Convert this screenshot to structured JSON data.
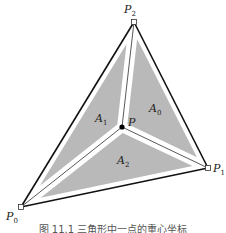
{
  "figure": {
    "caption": "图 11.1  三角形中一点的重心坐标",
    "colors": {
      "region_fill": "#b9b9b9",
      "gap": "#ffffff",
      "edge": "#111111",
      "point": "#000000"
    },
    "vertices": [
      {
        "id": "P0",
        "label": "P",
        "sub": "0"
      },
      {
        "id": "P1",
        "label": "P",
        "sub": "1"
      },
      {
        "id": "P2",
        "label": "P",
        "sub": "2"
      }
    ],
    "interior_point": {
      "label": "P"
    },
    "regions": [
      {
        "id": "A0",
        "label": "A",
        "sub": "0",
        "opposite_vertex": "P0",
        "between": [
          "P1",
          "P2"
        ]
      },
      {
        "id": "A1",
        "label": "A",
        "sub": "1",
        "opposite_vertex": "P1",
        "between": [
          "P2",
          "P0"
        ]
      },
      {
        "id": "A2",
        "label": "A",
        "sub": "2",
        "opposite_vertex": "P2",
        "between": [
          "P0",
          "P1"
        ]
      }
    ]
  }
}
